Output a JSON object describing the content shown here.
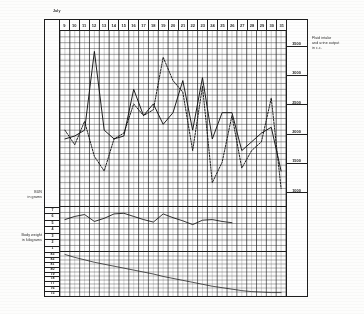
{
  "header": {
    "month_label": "July"
  },
  "axes": {
    "day_numbers": [
      "9",
      "10",
      "11",
      "12",
      "13",
      "14",
      "15",
      "16",
      "17",
      "18",
      "19",
      "20",
      "21",
      "22",
      "23",
      "24",
      "25",
      "26",
      "27",
      "28",
      "29",
      "30",
      "31"
    ],
    "fluid_right_ticks": [
      "3500",
      "3000",
      "2500",
      "2000",
      "1500",
      "1000"
    ],
    "bun_scale": [
      "7",
      "6",
      "5",
      "4",
      "3",
      "2",
      "1"
    ],
    "weight_scale": [
      "83",
      "82",
      "81",
      "80",
      "79",
      "78",
      "77",
      "76",
      "75"
    ]
  },
  "captions": {
    "fluid": "Fluid intake\nand urine output\nin c.c.",
    "bun": "BUN\nin grams",
    "weight": "Body weight\nin kilograms"
  },
  "chart_data": {
    "type": "line",
    "title": "Fluid intake and urine output in c.c.",
    "xlabel": "July",
    "ylabel": "c.c.",
    "grid": true,
    "legend": "none",
    "x": [
      "9",
      "10",
      "11",
      "12",
      "13",
      "14",
      "15",
      "16",
      "17",
      "18",
      "19",
      "20",
      "21",
      "22",
      "23",
      "24",
      "25",
      "26",
      "27",
      "28",
      "29",
      "30",
      "31"
    ],
    "panels": [
      {
        "name": "fluid",
        "ylabel": "Fluid intake and urine output in c.c.",
        "ylim": [
          750,
          3750
        ],
        "yticks": [
          1000,
          1500,
          2000,
          2500,
          3000,
          3500
        ],
        "series": [
          {
            "name": "Fluid intake",
            "style": "solid",
            "values": [
              1900,
              1950,
              2050,
              3400,
              2050,
              1900,
              1950,
              2750,
              2300,
              2500,
              2150,
              2350,
              2900,
              2050,
              2950,
              1900,
              2350,
              2350,
              1700,
              1850,
              2000,
              2100,
              1350
            ]
          },
          {
            "name": "Urine output",
            "style": "dashed",
            "values": [
              2050,
              1800,
              2200,
              1600,
              1350,
              1900,
              2000,
              2500,
              2300,
              2400,
              3300,
              2900,
              2700,
              1700,
              2800,
              1150,
              1500,
              2300,
              1400,
              1700,
              1850,
              2600,
              1050
            ]
          }
        ]
      },
      {
        "name": "bun",
        "ylabel": "BUN in grams",
        "ylim": [
          0.5,
          7.5
        ],
        "yticks": [
          1,
          2,
          3,
          4,
          5,
          6,
          7
        ],
        "series": [
          {
            "name": "BUN",
            "style": "solid",
            "values": [
              5.5,
              6.0,
              6.3,
              5.2,
              5.7,
              6.4,
              6.5,
              6.0,
              5.5,
              5.1,
              6.4,
              5.8,
              5.3,
              4.7,
              5.4,
              5.5,
              5.2,
              5.0,
              null,
              null,
              null,
              null,
              null
            ]
          }
        ]
      },
      {
        "name": "weight",
        "ylabel": "Body weight in kilograms",
        "ylim": [
          74.5,
          83.5
        ],
        "yticks": [
          75,
          76,
          77,
          78,
          79,
          80,
          81,
          82,
          83
        ],
        "series": [
          {
            "name": "Body weight",
            "style": "solid",
            "values": [
              83.0,
              82.4,
              81.9,
              81.4,
              81.0,
              80.6,
              80.2,
              79.8,
              79.4,
              79.0,
              78.5,
              78.1,
              77.7,
              77.3,
              76.9,
              76.5,
              76.2,
              75.9,
              75.6,
              75.4,
              75.3,
              75.2,
              75.2
            ]
          }
        ]
      }
    ]
  }
}
